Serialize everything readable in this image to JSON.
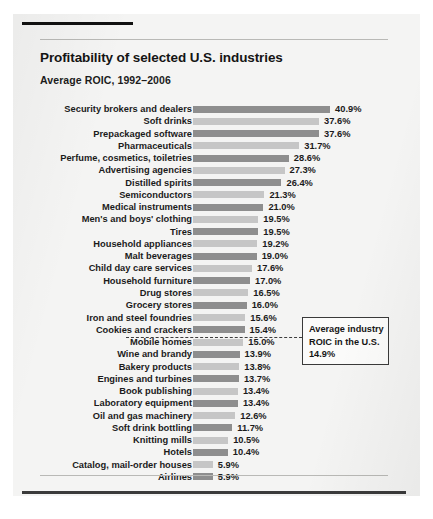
{
  "header": {
    "title": "Profitability of selected U.S. industries",
    "subtitle": "Average ROIC, 1992–2006"
  },
  "annotation": {
    "line1": "Average industry",
    "line2": "ROIC in the U.S.",
    "line3": "14.9%"
  },
  "chart_data": {
    "type": "bar",
    "orientation": "horizontal",
    "title": "Profitability of selected U.S. industries",
    "subtitle": "Average ROIC, 1992–2006",
    "xlabel": "",
    "ylabel": "",
    "xlim": [
      0,
      40.9
    ],
    "grid": false,
    "legend": null,
    "value_suffix": "%",
    "annotations": [
      {
        "text": "Average industry ROIC in the U.S. 14.9%",
        "value": 14.9,
        "style": "dashed-leader-box"
      }
    ],
    "bar_colors": {
      "dark": "#8e8e8e",
      "light": "#c6c6c6"
    },
    "categories": [
      "Security brokers and dealers",
      "Soft drinks",
      "Prepackaged software",
      "Pharmaceuticals",
      "Perfume, cosmetics, toiletries",
      "Advertising agencies",
      "Distilled spirits",
      "Semiconductors",
      "Medical instruments",
      "Men's and boys' clothing",
      "Tires",
      "Household appliances",
      "Malt beverages",
      "Child day care services",
      "Household furniture",
      "Drug stores",
      "Grocery stores",
      "Iron and steel foundries",
      "Cookies and crackers",
      "Mobile homes",
      "Wine and brandy",
      "Bakery products",
      "Engines and turbines",
      "Book publishing",
      "Laboratory equipment",
      "Oil and gas machinery",
      "Soft drink bottling",
      "Knitting mills",
      "Hotels",
      "Catalog, mail-order houses",
      "Airlines"
    ],
    "values": [
      40.9,
      37.6,
      37.6,
      31.7,
      28.6,
      27.3,
      26.4,
      21.3,
      21.0,
      19.5,
      19.5,
      19.2,
      19.0,
      17.6,
      17.0,
      16.5,
      16.0,
      15.6,
      15.4,
      15.0,
      13.9,
      13.8,
      13.7,
      13.4,
      13.4,
      12.6,
      11.7,
      10.5,
      10.4,
      5.9,
      5.9
    ],
    "value_labels": [
      "40.9%",
      "37.6%",
      "37.6%",
      "31.7%",
      "28.6%",
      "27.3%",
      "26.4%",
      "21.3%",
      "21.0%",
      "19.5%",
      "19.5%",
      "19.2%",
      "19.0%",
      "17.6%",
      "17.0%",
      "16.5%",
      "16.0%",
      "15.6%",
      "15.4%",
      "15.0%",
      "13.9%",
      "13.8%",
      "13.7%",
      "13.4%",
      "13.4%",
      "12.6%",
      "11.7%",
      "10.5%",
      "10.4%",
      "5.9%",
      "5.9%"
    ]
  }
}
